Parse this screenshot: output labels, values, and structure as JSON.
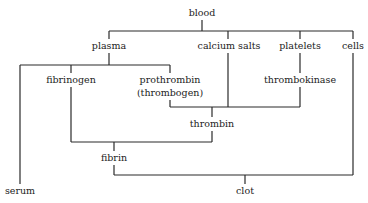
{
  "nodes": {
    "blood": "blood",
    "plasma": "plasma",
    "calcium_salts": "calcium  salts",
    "platelets": "platelets",
    "cells": "cells",
    "fibrinogen": "fibrinogen",
    "prothrombin": "prothrombin",
    "prothrombin_alt": "(thrombogen)",
    "thrombokinase": "thrombokinase",
    "thrombin": "thrombin",
    "fibrin": "fibrin",
    "serum": "serum",
    "clot": "clot"
  },
  "edges": [
    {
      "from": "blood",
      "to": [
        "plasma",
        "calcium_salts",
        "platelets",
        "cells"
      ]
    },
    {
      "from": "plasma",
      "to": [
        "serum",
        "fibrinogen",
        "prothrombin"
      ]
    },
    {
      "from": "platelets",
      "to": [
        "thrombokinase"
      ]
    },
    {
      "from": [
        "prothrombin",
        "calcium_salts",
        "thrombokinase"
      ],
      "to": "thrombin"
    },
    {
      "from": [
        "fibrinogen",
        "thrombin"
      ],
      "to": "fibrin"
    },
    {
      "from": [
        "fibrin",
        "cells"
      ],
      "to": "clot"
    }
  ]
}
